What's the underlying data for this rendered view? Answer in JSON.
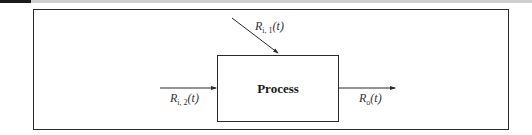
{
  "diagram": {
    "type": "block-diagram",
    "process": {
      "label": "Process"
    },
    "inputs": [
      {
        "id": "r_i1",
        "symbol": "R",
        "subscript": "i, 1",
        "arg": "(t)",
        "direction": "diagonal-from-top-left"
      },
      {
        "id": "r_i2",
        "symbol": "R",
        "subscript": "i, 2",
        "arg": "(t)",
        "direction": "from-left"
      }
    ],
    "outputs": [
      {
        "id": "r_o",
        "symbol": "R",
        "subscript": "o",
        "arg": "(t)",
        "direction": "to-right"
      }
    ],
    "colors": {
      "stroke": "#2a2a2a",
      "text": "#1a1a1a",
      "background": "#ffffff"
    }
  }
}
